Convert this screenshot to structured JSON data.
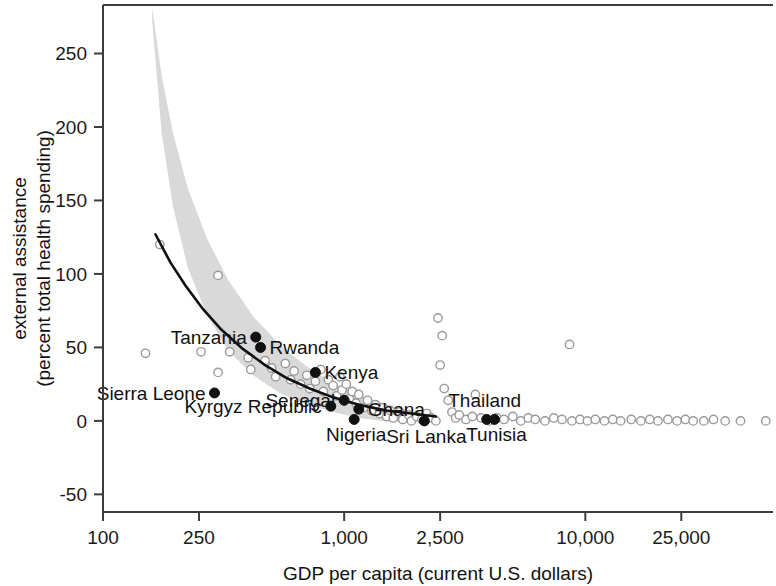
{
  "chart_data": {
    "type": "scatter",
    "title": "",
    "subtitle": "",
    "xlabel": "GDP per capita (current U.S. dollars)",
    "ylabel": "external assistance\n(percent total health spending)",
    "ylabel_line1": "external assistance",
    "ylabel_line2": "(percent total health spending)",
    "xscale": "log",
    "yscale": "linear",
    "xlim": [
      100,
      60000
    ],
    "ylim": [
      -62,
      283
    ],
    "grid": false,
    "legend": "none",
    "xticks": [
      100,
      250,
      1000,
      2500,
      10000,
      25000
    ],
    "xtick_labels": [
      "100",
      "250",
      "1,000",
      "2,500",
      "10,000",
      "25,000"
    ],
    "yticks": [
      -50,
      0,
      50,
      100,
      150,
      200,
      250
    ],
    "ytick_labels": [
      "-50",
      "0",
      "50",
      "100",
      "150",
      "200",
      "250"
    ],
    "fit_curve": {
      "name": "fitted trend (lowess / log fit)",
      "points": [
        {
          "x": 165,
          "y": 127
        },
        {
          "x": 190,
          "y": 108
        },
        {
          "x": 220,
          "y": 92
        },
        {
          "x": 260,
          "y": 76
        },
        {
          "x": 310,
          "y": 62
        },
        {
          "x": 380,
          "y": 49
        },
        {
          "x": 470,
          "y": 38
        },
        {
          "x": 580,
          "y": 29
        },
        {
          "x": 720,
          "y": 22
        },
        {
          "x": 900,
          "y": 16
        },
        {
          "x": 1150,
          "y": 11
        },
        {
          "x": 1500,
          "y": 7
        },
        {
          "x": 1900,
          "y": 5
        },
        {
          "x": 2400,
          "y": 3
        }
      ]
    },
    "confidence_band": {
      "name": "95% confidence interval",
      "color": "#d9d9d9",
      "upper": [
        {
          "x": 160,
          "y": 281
        },
        {
          "x": 175,
          "y": 235
        },
        {
          "x": 195,
          "y": 196
        },
        {
          "x": 225,
          "y": 158
        },
        {
          "x": 270,
          "y": 124
        },
        {
          "x": 330,
          "y": 96
        },
        {
          "x": 420,
          "y": 71
        },
        {
          "x": 540,
          "y": 52
        },
        {
          "x": 700,
          "y": 37
        },
        {
          "x": 900,
          "y": 26
        },
        {
          "x": 1150,
          "y": 18
        },
        {
          "x": 1450,
          "y": 12
        },
        {
          "x": 1800,
          "y": 8
        }
      ],
      "lower": [
        {
          "x": 160,
          "y": 272
        },
        {
          "x": 175,
          "y": 196
        },
        {
          "x": 195,
          "y": 146
        },
        {
          "x": 225,
          "y": 104
        },
        {
          "x": 270,
          "y": 72
        },
        {
          "x": 330,
          "y": 48
        },
        {
          "x": 420,
          "y": 31
        },
        {
          "x": 540,
          "y": 19
        },
        {
          "x": 700,
          "y": 11
        },
        {
          "x": 900,
          "y": 6
        },
        {
          "x": 1150,
          "y": 2
        },
        {
          "x": 1450,
          "y": 0
        },
        {
          "x": 1800,
          "y": -1
        }
      ]
    },
    "labeled_points": [
      {
        "label": "Tanzania",
        "x": 430,
        "y": 57,
        "label_pos": "left"
      },
      {
        "label": "Rwanda",
        "x": 450,
        "y": 50,
        "label_pos": "right"
      },
      {
        "label": "Kenya",
        "x": 760,
        "y": 33,
        "label_pos": "right"
      },
      {
        "label": "Sierra Leone",
        "x": 290,
        "y": 19,
        "label_pos": "left"
      },
      {
        "label": "Senegal",
        "x": 1000,
        "y": 14,
        "label_pos": "left"
      },
      {
        "label": "Kyrgyz Republic",
        "x": 880,
        "y": 10,
        "label_pos": "left"
      },
      {
        "label": "Ghana",
        "x": 1150,
        "y": 8,
        "label_pos": "right"
      },
      {
        "label": "Nigeria",
        "x": 1100,
        "y": 1,
        "label_pos": "below"
      },
      {
        "label": "Sri Lanka",
        "x": 2150,
        "y": 0,
        "label_pos": "below"
      },
      {
        "label": "Thailand",
        "x": 3900,
        "y": 1,
        "label_pos": "above"
      },
      {
        "label": "Tunisia",
        "x": 4200,
        "y": 1,
        "label_pos": "below"
      }
    ],
    "unlabeled_points": [
      {
        "x": 172,
        "y": 120
      },
      {
        "x": 300,
        "y": 99
      },
      {
        "x": 150,
        "y": 46
      },
      {
        "x": 255,
        "y": 47
      },
      {
        "x": 335,
        "y": 47
      },
      {
        "x": 300,
        "y": 33
      },
      {
        "x": 400,
        "y": 43
      },
      {
        "x": 410,
        "y": 35
      },
      {
        "x": 470,
        "y": 41
      },
      {
        "x": 500,
        "y": 36
      },
      {
        "x": 520,
        "y": 30
      },
      {
        "x": 570,
        "y": 39
      },
      {
        "x": 600,
        "y": 28
      },
      {
        "x": 620,
        "y": 34
      },
      {
        "x": 660,
        "y": 25
      },
      {
        "x": 700,
        "y": 31
      },
      {
        "x": 720,
        "y": 22
      },
      {
        "x": 760,
        "y": 27
      },
      {
        "x": 800,
        "y": 35
      },
      {
        "x": 820,
        "y": 20
      },
      {
        "x": 860,
        "y": 28
      },
      {
        "x": 900,
        "y": 24
      },
      {
        "x": 930,
        "y": 17
      },
      {
        "x": 960,
        "y": 30
      },
      {
        "x": 980,
        "y": 21
      },
      {
        "x": 1020,
        "y": 25
      },
      {
        "x": 1050,
        "y": 15
      },
      {
        "x": 1080,
        "y": 20
      },
      {
        "x": 1120,
        "y": 12
      },
      {
        "x": 1150,
        "y": 18
      },
      {
        "x": 1200,
        "y": 9
      },
      {
        "x": 1250,
        "y": 14
      },
      {
        "x": 1300,
        "y": 7
      },
      {
        "x": 1350,
        "y": 11
      },
      {
        "x": 1400,
        "y": 5
      },
      {
        "x": 1450,
        "y": 9
      },
      {
        "x": 1500,
        "y": 3
      },
      {
        "x": 1550,
        "y": 7
      },
      {
        "x": 1600,
        "y": 2
      },
      {
        "x": 1700,
        "y": 6
      },
      {
        "x": 1750,
        "y": 1
      },
      {
        "x": 1850,
        "y": 4
      },
      {
        "x": 1900,
        "y": 0
      },
      {
        "x": 2000,
        "y": 3
      },
      {
        "x": 2100,
        "y": 1
      },
      {
        "x": 2200,
        "y": 5
      },
      {
        "x": 2300,
        "y": 2
      },
      {
        "x": 2400,
        "y": 0
      },
      {
        "x": 2450,
        "y": 70
      },
      {
        "x": 2550,
        "y": 58
      },
      {
        "x": 2500,
        "y": 38
      },
      {
        "x": 2600,
        "y": 22
      },
      {
        "x": 2700,
        "y": 14
      },
      {
        "x": 2800,
        "y": 6
      },
      {
        "x": 2900,
        "y": 2
      },
      {
        "x": 3000,
        "y": 4
      },
      {
        "x": 3200,
        "y": 1
      },
      {
        "x": 3400,
        "y": 3
      },
      {
        "x": 3500,
        "y": 18
      },
      {
        "x": 3700,
        "y": 2
      },
      {
        "x": 4000,
        "y": 0
      },
      {
        "x": 4300,
        "y": 2
      },
      {
        "x": 4600,
        "y": 1
      },
      {
        "x": 5000,
        "y": 3
      },
      {
        "x": 5400,
        "y": 0
      },
      {
        "x": 5800,
        "y": 2
      },
      {
        "x": 6200,
        "y": 1
      },
      {
        "x": 6800,
        "y": 0
      },
      {
        "x": 7400,
        "y": 2
      },
      {
        "x": 8000,
        "y": 1
      },
      {
        "x": 8600,
        "y": 52
      },
      {
        "x": 8800,
        "y": 0
      },
      {
        "x": 9500,
        "y": 1
      },
      {
        "x": 10200,
        "y": 0
      },
      {
        "x": 11000,
        "y": 1
      },
      {
        "x": 12000,
        "y": 0
      },
      {
        "x": 13000,
        "y": 1
      },
      {
        "x": 14000,
        "y": 0
      },
      {
        "x": 15500,
        "y": 1
      },
      {
        "x": 17000,
        "y": 0
      },
      {
        "x": 18500,
        "y": 1
      },
      {
        "x": 20000,
        "y": 0
      },
      {
        "x": 22000,
        "y": 1
      },
      {
        "x": 24000,
        "y": 0
      },
      {
        "x": 26000,
        "y": 1
      },
      {
        "x": 28000,
        "y": 0
      },
      {
        "x": 31000,
        "y": 0
      },
      {
        "x": 34000,
        "y": 1
      },
      {
        "x": 38000,
        "y": 0
      },
      {
        "x": 44000,
        "y": 0
      },
      {
        "x": 56000,
        "y": 0
      }
    ],
    "marker_legend": {
      "filled": "labeled country",
      "open": "other country"
    }
  }
}
